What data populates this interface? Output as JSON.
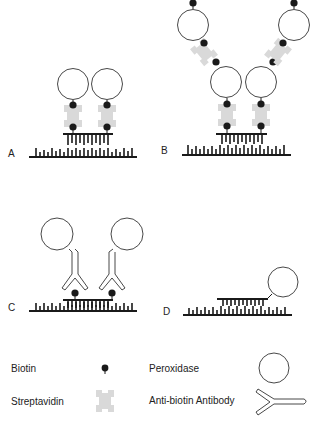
{
  "figure": {
    "panels": [
      {
        "id": "A",
        "label": "A"
      },
      {
        "id": "B",
        "label": "B"
      },
      {
        "id": "C",
        "label": "C"
      },
      {
        "id": "D",
        "label": "D"
      }
    ],
    "legend": {
      "items": [
        {
          "name": "Biotin",
          "label": "Biotin",
          "icon": "biotin-dot-icon"
        },
        {
          "name": "Streptavidin",
          "label": "Streptavidin",
          "icon": "streptavidin-cross-icon"
        },
        {
          "name": "Peroxidase",
          "label": "Peroxidase",
          "icon": "peroxidase-circle-icon"
        },
        {
          "name": "Anti-biotin Antibody",
          "label": "Anti-biotin Antibody",
          "icon": "antibody-y-icon"
        }
      ]
    },
    "colors": {
      "ink": "#1a1a1a",
      "streptavidin": "#d9d9d9",
      "background": "#ffffff"
    }
  }
}
